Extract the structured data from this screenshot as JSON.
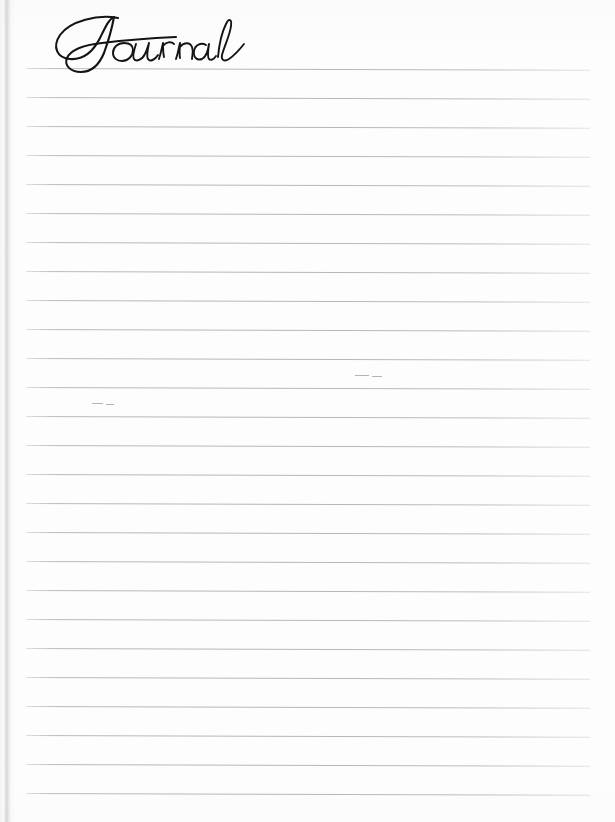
{
  "document": {
    "type": "lined-journal-page",
    "title": "Journal",
    "title_style": "handwritten-script",
    "content_text": "",
    "is_blank": true
  },
  "page": {
    "width_px": 615,
    "height_px": 822,
    "background_color": "#fdfdfd",
    "paper_color": "#fdfdfd"
  },
  "ruled_lines": {
    "count": 26,
    "color": "#b9b9c0",
    "thickness_px": 1,
    "spacing_px": 29,
    "first_line_y_px": 68,
    "last_line_y_px": 793,
    "left_margin_px": 26,
    "right_margin_px": 25,
    "line_length_px": 564,
    "skew_deg": 0.18,
    "y_positions": [
      68,
      97,
      126,
      155,
      184,
      213,
      242,
      271,
      300,
      329,
      358,
      387,
      416,
      445,
      474,
      503,
      532,
      561,
      590,
      619,
      648,
      677,
      706,
      735,
      764,
      793
    ]
  },
  "artifacts": {
    "binding_edge": {
      "side": "left",
      "x_px": 4,
      "width_px": 7,
      "color": "#787880"
    },
    "specks": [
      {
        "x": 355,
        "y": 375,
        "width": 14
      },
      {
        "x": 372,
        "y": 376,
        "width": 10
      },
      {
        "x": 92,
        "y": 403,
        "width": 11
      },
      {
        "x": 106,
        "y": 404,
        "width": 8
      }
    ]
  },
  "colors": {
    "ink": "#141414",
    "rule": "#b9b9c0",
    "paper": "#fdfdfd",
    "edge_shadow": "#787880"
  }
}
